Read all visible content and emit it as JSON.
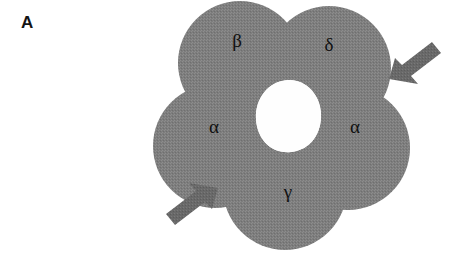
{
  "figure": {
    "panel_label": "A",
    "type": "receptor-topology-diagram"
  },
  "receptor": {
    "pore_label": "",
    "subunits": [
      {
        "id": "beta",
        "label": "β",
        "x": 237,
        "y": 47,
        "lobe_cx": 240,
        "lobe_cy": 63,
        "lobe_r": 62
      },
      {
        "id": "delta",
        "label": "δ",
        "x": 329,
        "y": 51,
        "lobe_cx": 329,
        "lobe_cy": 68,
        "lobe_r": 62
      },
      {
        "id": "alpha-right",
        "label": "α",
        "x": 355,
        "y": 133,
        "lobe_cx": 348,
        "lobe_cy": 148,
        "lobe_r": 62
      },
      {
        "id": "gamma",
        "label": "γ",
        "x": 288,
        "y": 198,
        "lobe_cx": 285,
        "lobe_cy": 188,
        "lobe_r": 62
      },
      {
        "id": "alpha-left",
        "label": "α",
        "x": 214,
        "y": 133,
        "lobe_cx": 215,
        "lobe_cy": 146,
        "lobe_r": 62
      }
    ]
  },
  "annotations": {
    "arrows": [
      {
        "id": "arrow-top-right",
        "label": "",
        "direction": "down-left",
        "tip_x": 389,
        "tip_y": 79,
        "tail_x": 440,
        "tail_y": 46
      },
      {
        "id": "arrow-bottom-left",
        "label": "",
        "direction": "up-right",
        "tip_x": 218,
        "tip_y": 188,
        "tail_x": 167,
        "tail_y": 221
      }
    ]
  },
  "colors": {
    "body_fill": "#7d7d7d",
    "body_fill_light": "#8a8a8a",
    "pore_fill": "#fefefe",
    "arrow_fill": "#686868",
    "text": "#111111",
    "panel_label": "#141414",
    "background": "#ffffff"
  }
}
